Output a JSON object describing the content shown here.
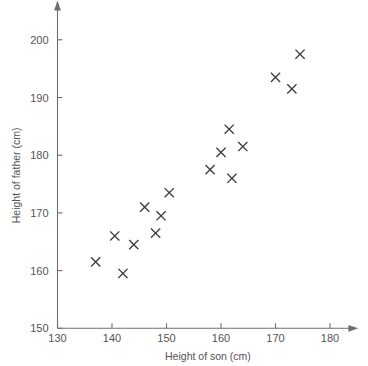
{
  "chart_data": {
    "type": "scatter",
    "title": "",
    "xlabel": "Height of son (cm)",
    "ylabel": "Height of father (cm)",
    "xlim": [
      130,
      183
    ],
    "ylim": [
      150,
      203
    ],
    "xticks": [
      130,
      140,
      150,
      160,
      170,
      180
    ],
    "yticks": [
      150,
      160,
      170,
      180,
      190,
      200
    ],
    "xtick_labels": [
      "130",
      "140",
      "150",
      "160",
      "170",
      "180"
    ],
    "ytick_labels": [
      "150",
      "160",
      "170",
      "180",
      "190",
      "200"
    ],
    "grid": false,
    "legend": "none",
    "marker": "x",
    "marker_color": "#3d3d3d",
    "axis_color": "#6e6e6e",
    "points": [
      {
        "x": 137.0,
        "y": 161.5
      },
      {
        "x": 140.5,
        "y": 166.0
      },
      {
        "x": 142.0,
        "y": 159.5
      },
      {
        "x": 144.0,
        "y": 164.5
      },
      {
        "x": 146.0,
        "y": 171.0
      },
      {
        "x": 148.0,
        "y": 166.5
      },
      {
        "x": 149.0,
        "y": 169.5
      },
      {
        "x": 150.5,
        "y": 173.5
      },
      {
        "x": 158.0,
        "y": 177.5
      },
      {
        "x": 160.0,
        "y": 180.5
      },
      {
        "x": 161.5,
        "y": 184.5
      },
      {
        "x": 162.0,
        "y": 176.0
      },
      {
        "x": 164.0,
        "y": 181.5
      },
      {
        "x": 170.0,
        "y": 193.5
      },
      {
        "x": 173.0,
        "y": 191.5
      },
      {
        "x": 174.5,
        "y": 197.5
      }
    ]
  }
}
